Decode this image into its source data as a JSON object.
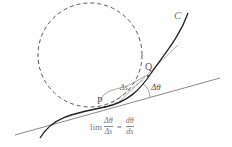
{
  "diagram": {
    "labels": {
      "curve": "C",
      "point_p": "P",
      "point_q": "Q",
      "arc_length": "Δs",
      "angle": "Δθ"
    },
    "formula": {
      "lim": "lim",
      "lhs_num": "Δθ",
      "lhs_den": "Δs",
      "equals": "=",
      "rhs_num": "dθ",
      "rhs_den": "ds"
    },
    "colors": {
      "curve": "#222222",
      "circle": "#444444",
      "tangent": "#555555",
      "label": "#555555"
    },
    "elements": [
      {
        "id": "osculating-circle",
        "type": "circle",
        "style": "dashed",
        "cx": 90,
        "cy": 55,
        "r": 52
      },
      {
        "id": "curve-c",
        "type": "curve",
        "from": [
          40,
          138
        ],
        "through": [
          [
            105,
            107
          ],
          [
            148,
            75
          ]
        ],
        "to": [
          188,
          13
        ]
      },
      {
        "id": "tangent-at-p",
        "type": "line",
        "from": [
          15,
          135
        ],
        "to": [
          220,
          78
        ]
      },
      {
        "id": "tangent-at-q",
        "type": "line",
        "from": [
          118,
          103
        ],
        "to": [
          178,
          45
        ]
      },
      {
        "id": "angle-arc",
        "type": "arc",
        "label": "Δθ"
      },
      {
        "id": "arc-length-brace",
        "type": "brace",
        "label": "Δs"
      }
    ]
  }
}
